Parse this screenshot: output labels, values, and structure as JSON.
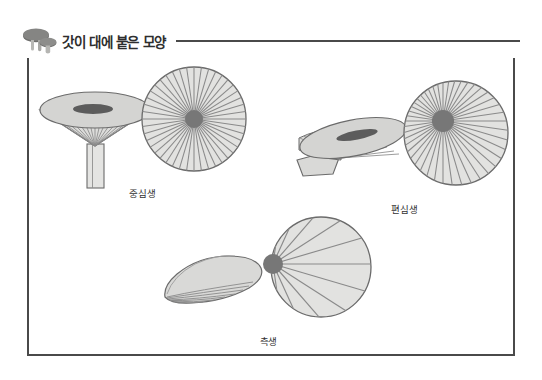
{
  "header": {
    "icon": "mushroom-icon",
    "title": "갓이 대에 붙은 모양"
  },
  "figures": [
    {
      "id": "central",
      "label": "중심생",
      "side_view_name": "mushroom-side-view-central",
      "cap_view_name": "mushroom-cap-view-central",
      "hub_position": "center",
      "gill_count": 44
    },
    {
      "id": "eccentric",
      "label": "편심생",
      "side_view_name": "mushroom-side-view-eccentric",
      "cap_view_name": "mushroom-cap-view-eccentric",
      "hub_position": "upper-left-offset",
      "gill_count": 44
    },
    {
      "id": "lateral",
      "label": "측생",
      "side_view_name": "mushroom-side-view-lateral",
      "cap_view_name": "mushroom-cap-view-lateral",
      "hub_position": "left-edge",
      "gill_count": 22
    }
  ],
  "colors": {
    "border": "#4a4a4a",
    "outline": "#6b6b6b",
    "cap_fill": "#d4d4d2",
    "gill_fill": "#e2e2e0",
    "hub_fill": "#777777",
    "slit_fill": "#5c5c5c",
    "title_text": "#2e2e2e",
    "label_text": "#333333",
    "background": "#ffffff"
  }
}
